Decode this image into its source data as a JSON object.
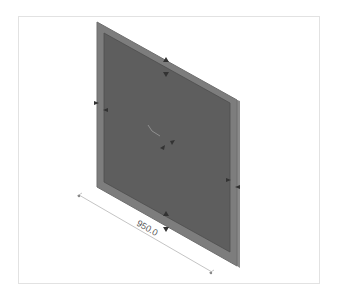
{
  "model": {
    "object": "rectangular panel with frame",
    "view": "isometric",
    "colors": {
      "frame": "#7d7d7d",
      "frame_edge": "#6a6a6a",
      "panel_face": "#5f5f5f",
      "dimension_line": "#b0b0b0",
      "arrow": "#3a3a3a"
    }
  },
  "dimension": {
    "label": "950.0"
  }
}
